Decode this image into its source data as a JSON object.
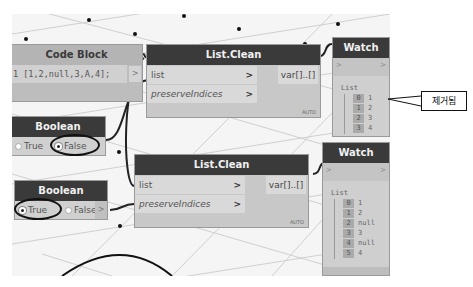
{
  "canvas": {
    "background": "#f5f5f5",
    "node_header_color": "#3a3a3a"
  },
  "code_block": {
    "title": "Code Block",
    "code": "1 [1,2,null,3,A,4];",
    "output_port": ">"
  },
  "list_clean_1": {
    "title": "List.Clean",
    "inputs": [
      {
        "label": "list",
        "arrow": ">"
      },
      {
        "label": "preserveIndices",
        "arrow": ">"
      }
    ],
    "output": "var[]..[]",
    "lacing": "AUTO"
  },
  "list_clean_2": {
    "title": "List.Clean",
    "inputs": [
      {
        "label": "list",
        "arrow": ">"
      },
      {
        "label": "preserveIndices",
        "arrow": ">"
      }
    ],
    "output": "var[]..[]",
    "lacing": "AUTO"
  },
  "boolean_1": {
    "title": "Boolean",
    "options": [
      "True",
      "False"
    ],
    "selected": "False",
    "output_port": ">"
  },
  "boolean_2": {
    "title": "Boolean",
    "options": [
      "True",
      "False"
    ],
    "selected": "True",
    "output_port": ">"
  },
  "watch_1": {
    "title": "Watch",
    "in_port": ">",
    "out_port": ">",
    "root": "List",
    "items": [
      {
        "index": "0",
        "value": "1"
      },
      {
        "index": "1",
        "value": "2"
      },
      {
        "index": "2",
        "value": "3"
      },
      {
        "index": "3",
        "value": "4"
      }
    ]
  },
  "watch_2": {
    "title": "Watch",
    "in_port": ">",
    "out_port": ">",
    "root": "List",
    "items": [
      {
        "index": "0",
        "value": "1"
      },
      {
        "index": "1",
        "value": "2"
      },
      {
        "index": "2",
        "value": "null"
      },
      {
        "index": "3",
        "value": "3"
      },
      {
        "index": "4",
        "value": "null"
      },
      {
        "index": "5",
        "value": "4"
      }
    ]
  },
  "annotation": {
    "text": "제거됨"
  }
}
